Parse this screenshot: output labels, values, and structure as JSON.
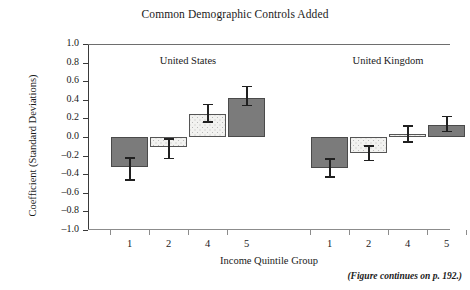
{
  "chart_data": {
    "type": "bar",
    "title": "Common Demographic Controls Added",
    "xlabel": "Income Quintile Group",
    "ylabel": "Coefficient (Standard Deviations)",
    "ylim": [
      -1.0,
      1.0
    ],
    "ytick_labels": [
      "1.0",
      "0.8",
      "0.6",
      "0.4",
      "0.2",
      "0.0",
      "–0.2",
      "–0.4",
      "–0.6",
      "–0.8",
      "–1.0"
    ],
    "ytick_values": [
      1.0,
      0.8,
      0.6,
      0.4,
      0.2,
      0.0,
      -0.2,
      -0.4,
      -0.6,
      -0.8,
      -1.0
    ],
    "grid": false,
    "legend": "none",
    "panels": [
      {
        "label": "United States",
        "categories": [
          "1",
          "2",
          "4",
          "5"
        ],
        "values": [
          -0.32,
          -0.11,
          0.25,
          0.42
        ],
        "errors_low": [
          -0.47,
          -0.24,
          0.15,
          0.33
        ],
        "errors_high": [
          -0.22,
          -0.01,
          0.36,
          0.55
        ],
        "fills": [
          "dark",
          "light",
          "light",
          "dark"
        ]
      },
      {
        "label": "United Kingdom",
        "categories": [
          "1",
          "2",
          "4",
          "5"
        ],
        "values": [
          -0.33,
          -0.17,
          0.03,
          0.13
        ],
        "errors_low": [
          -0.44,
          -0.26,
          -0.06,
          0.05
        ],
        "errors_high": [
          -0.23,
          -0.09,
          0.13,
          0.23
        ],
        "fills": [
          "dark",
          "light",
          "light",
          "dark"
        ]
      }
    ],
    "annotations": [
      "(Figure continues on p. 192.)"
    ]
  },
  "footnote": "(Figure continues on p. 192.)",
  "colors": {
    "bar_dark": "#7b7b7b",
    "bar_light": "#f2f2f0",
    "axis": "#3a3a3a",
    "error": "#202020"
  }
}
